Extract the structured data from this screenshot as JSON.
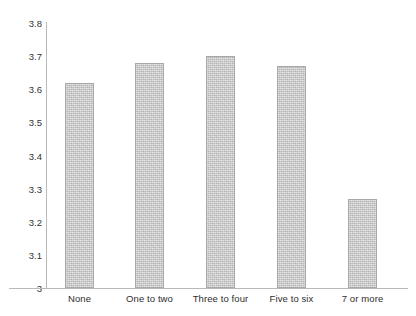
{
  "chart_data": {
    "type": "bar",
    "title": "",
    "subtitle": "",
    "xlabel": "",
    "ylabel": "",
    "categories": [
      "None",
      "One to two",
      "Three to four",
      "Five to six",
      "7 or more"
    ],
    "values": [
      3.62,
      3.68,
      3.7,
      3.67,
      3.27
    ],
    "ylim": [
      3.0,
      3.8
    ],
    "ytick_labels": [
      "3.8",
      "3.7",
      "3.6",
      "3.5",
      "3.4",
      "3.3",
      "3.2",
      "3.1",
      "3"
    ],
    "ytick_values": [
      3.8,
      3.7,
      3.6,
      3.5,
      3.4,
      3.3,
      3.2,
      3.1,
      3.0
    ],
    "grid": false,
    "legend": null,
    "legend_position": "none",
    "series": [
      {
        "name": "",
        "values": [
          3.62,
          3.68,
          3.7,
          3.67,
          3.27
        ]
      }
    ],
    "bar_color": "#c8c8c8",
    "bar_border_color": "#a8a8a8",
    "axis_color": "#b9b9b9",
    "text_color": "#2e2e2e",
    "background_color": "#ffffff"
  },
  "axis": {
    "y_ticks": [
      {
        "label": "3.8",
        "value": 3.8
      },
      {
        "label": "3.7",
        "value": 3.7
      },
      {
        "label": "3.6",
        "value": 3.6
      },
      {
        "label": "3.5",
        "value": 3.5
      },
      {
        "label": "3.4",
        "value": 3.4
      },
      {
        "label": "3.3",
        "value": 3.3
      },
      {
        "label": "3.2",
        "value": 3.2
      },
      {
        "label": "3.1",
        "value": 3.1
      },
      {
        "label": "3",
        "value": 3.0
      }
    ],
    "x_categories": [
      {
        "label": "None",
        "value": 3.62
      },
      {
        "label": "One to two",
        "value": 3.68
      },
      {
        "label": "Three to four",
        "value": 3.7
      },
      {
        "label": "Five to six",
        "value": 3.67
      },
      {
        "label": "7 or more",
        "value": 3.27
      }
    ]
  }
}
